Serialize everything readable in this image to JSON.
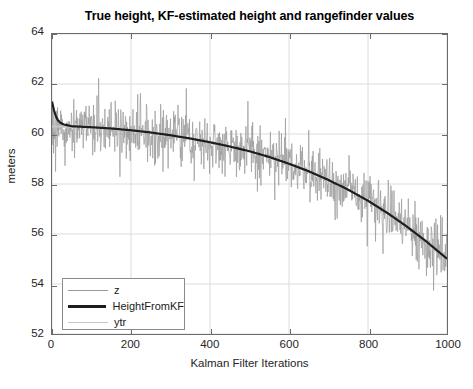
{
  "chart_data": {
    "type": "line",
    "title": "True height, KF-estimated height and rangefinder values",
    "xlabel": "Kalman Filter Iterations",
    "ylabel": "meters",
    "xlim": [
      0,
      1000
    ],
    "ylim": [
      52,
      64
    ],
    "xticks": [
      0,
      200,
      400,
      600,
      800,
      1000
    ],
    "yticks": [
      52,
      54,
      56,
      58,
      60,
      62,
      64
    ],
    "xtick_labels": [
      "0",
      "200",
      "400",
      "600",
      "800",
      "1000"
    ],
    "ytick_labels": [
      "52",
      "54",
      "56",
      "58",
      "60",
      "62",
      "64"
    ],
    "grid": true,
    "legend_position": "lower left",
    "legend": [
      {
        "name": "z",
        "color": "#9a9a9a",
        "width": 1,
        "style": "noisy"
      },
      {
        "name": "HeightFromKF",
        "color": "#1d1d1d",
        "width": 3,
        "style": "solid"
      },
      {
        "name": "ytr",
        "color": "#c6c6c6",
        "width": 1,
        "style": "solid"
      }
    ],
    "series": [
      {
        "name": "ytr",
        "color": "#c6c6c6",
        "description": "True height, smooth concave-down descent",
        "x": [
          0,
          50,
          100,
          150,
          200,
          250,
          300,
          350,
          400,
          450,
          500,
          550,
          600,
          650,
          700,
          750,
          800,
          850,
          900,
          950,
          1000
        ],
        "values": [
          60.3,
          60.29,
          60.26,
          60.21,
          60.14,
          60.05,
          59.94,
          59.81,
          59.66,
          59.49,
          59.3,
          59.07,
          58.8,
          58.5,
          58.15,
          57.76,
          57.32,
          56.82,
          56.27,
          55.66,
          55.0
        ]
      },
      {
        "name": "HeightFromKF",
        "color": "#1d1d1d",
        "description": "Kalman filter estimate; initial transient spike to ~61.3 at start then converges onto true height",
        "x": [
          0,
          5,
          10,
          15,
          20,
          30,
          50,
          100,
          150,
          200,
          250,
          300,
          350,
          400,
          450,
          500,
          550,
          600,
          650,
          700,
          750,
          800,
          850,
          900,
          950,
          1000
        ],
        "values": [
          61.3,
          60.95,
          60.7,
          60.55,
          60.46,
          60.38,
          60.31,
          60.27,
          60.22,
          60.15,
          60.06,
          59.95,
          59.82,
          59.67,
          59.5,
          59.31,
          59.08,
          58.81,
          58.51,
          58.16,
          57.77,
          57.33,
          56.83,
          56.28,
          55.67,
          55.01
        ]
      },
      {
        "name": "z",
        "color": "#9a9a9a",
        "description": "Noisy rangefinder measurements: true height plus zero-mean noise of roughly +/- 2 meters, sampled every iteration",
        "noise_amplitude": 2.0,
        "noise_std": 0.8,
        "samples": 1000
      }
    ],
    "annotations": []
  }
}
